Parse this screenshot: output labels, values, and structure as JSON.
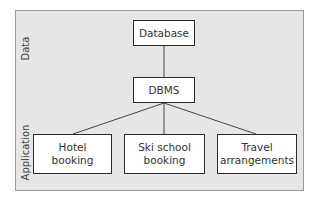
{
  "diagram": {
    "type": "hierarchy",
    "layers": [
      {
        "label": "Data"
      },
      {
        "label": "Application"
      }
    ],
    "nodes": [
      {
        "id": "database",
        "label": "Database"
      },
      {
        "id": "dbms",
        "label": "DBMS"
      },
      {
        "id": "hotel",
        "label_line1": "Hotel",
        "label_line2": "booking"
      },
      {
        "id": "ski",
        "label_line1": "Ski school",
        "label_line2": "booking"
      },
      {
        "id": "travel",
        "label_line1": "Travel",
        "label_line2": "arrangements"
      }
    ],
    "edges": [
      {
        "from": "database",
        "to": "dbms"
      },
      {
        "from": "dbms",
        "to": "hotel"
      },
      {
        "from": "dbms",
        "to": "ski"
      },
      {
        "from": "dbms",
        "to": "travel"
      }
    ],
    "colors": {
      "panel_background": "#e6e6e6",
      "panel_border": "#9a9a9a",
      "node_fill": "#ffffff",
      "node_border": "#2b2b2b",
      "edge": "#444444",
      "text": "#333333"
    }
  }
}
